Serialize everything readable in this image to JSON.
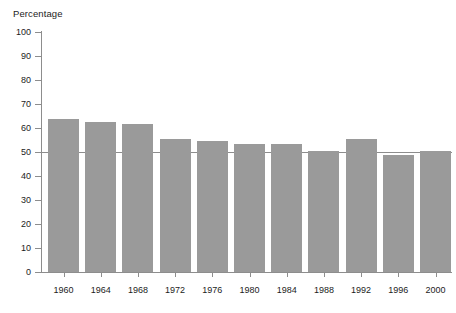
{
  "chart_data": {
    "type": "bar",
    "title": "",
    "subtitle": "",
    "xlabel": "",
    "ylabel": "Percentage",
    "ylim": [
      0,
      100
    ],
    "ytick_step": 10,
    "yticks": [
      "0",
      "10",
      "20",
      "30",
      "40",
      "50",
      "60",
      "70",
      "80",
      "90",
      "100"
    ],
    "grid": false,
    "legend": null,
    "bar_color": "#9a9a9a",
    "axis_color": "#8d8d8d",
    "reference_line": {
      "value": 50,
      "color": "#8d8d8d",
      "label": ""
    },
    "categories": [
      "1960",
      "1964",
      "1968",
      "1972",
      "1976",
      "1980",
      "1984",
      "1988",
      "1992",
      "1996",
      "2000"
    ],
    "values": [
      63.8,
      62.5,
      61.5,
      55.5,
      54.5,
      53.5,
      53.5,
      50.3,
      55.5,
      48.8,
      50.3
    ]
  }
}
